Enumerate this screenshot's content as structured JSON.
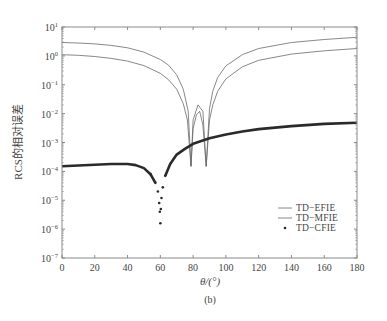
{
  "chart_data": {
    "type": "line",
    "title": "",
    "caption": "(b)",
    "xlabel": "θ/(°)",
    "ylabel": "RCS的相对误差",
    "xlim": [
      0,
      180
    ],
    "ylim": [
      1e-07,
      10
    ],
    "yscale": "log",
    "grid": false,
    "legend_position": "lower right",
    "x_ticks": [
      0,
      20,
      40,
      60,
      80,
      100,
      120,
      140,
      160,
      180
    ],
    "y_tick_labels": [
      {
        "base": "10",
        "exp": "1",
        "value": 10.0
      },
      {
        "base": "10",
        "exp": "0",
        "value": 1.0
      },
      {
        "base": "10",
        "exp": "−1",
        "value": 0.1
      },
      {
        "base": "10",
        "exp": "−2",
        "value": 0.01
      },
      {
        "base": "10",
        "exp": "−3",
        "value": 0.001
      },
      {
        "base": "10",
        "exp": "−4",
        "value": 0.0001
      },
      {
        "base": "10",
        "exp": "−5",
        "value": 1e-05
      },
      {
        "base": "10",
        "exp": "−6",
        "value": 1e-06
      },
      {
        "base": "10",
        "exp": "−7",
        "value": 1e-07
      }
    ],
    "series": [
      {
        "name": "TD−EFIE",
        "style": "thin-line",
        "color": "#555555",
        "x": [
          0,
          10,
          20,
          30,
          40,
          50,
          60,
          65,
          70,
          74,
          77,
          78.7,
          80,
          83,
          86,
          88,
          90,
          92,
          95,
          100,
          110,
          120,
          140,
          160,
          180
        ],
        "y": [
          2.9,
          2.8,
          2.6,
          2.3,
          1.9,
          1.35,
          0.75,
          0.48,
          0.22,
          0.07,
          0.012,
          0.00015,
          0.006,
          0.02,
          0.012,
          0.00015,
          0.015,
          0.06,
          0.18,
          0.45,
          1.1,
          1.8,
          2.9,
          3.7,
          4.4
        ]
      },
      {
        "name": "TD−MFIE",
        "style": "thin-line",
        "color": "#555555",
        "x": [
          0,
          10,
          20,
          30,
          40,
          50,
          60,
          65,
          70,
          74,
          76.5,
          78.7,
          80,
          82,
          84,
          86,
          88,
          90,
          92,
          95,
          100,
          110,
          120,
          140,
          160,
          180
        ],
        "y": [
          1.1,
          1.05,
          0.95,
          0.82,
          0.66,
          0.46,
          0.25,
          0.15,
          0.07,
          0.022,
          0.006,
          0.00015,
          0.003,
          0.009,
          0.012,
          0.004,
          0.00015,
          0.006,
          0.02,
          0.06,
          0.16,
          0.42,
          0.7,
          1.15,
          1.5,
          1.8
        ]
      },
      {
        "name": "TD−CFIE",
        "style": "dots",
        "color": "#222222",
        "x": [
          0,
          10,
          20,
          30,
          40,
          45,
          50,
          54,
          57,
          58.5,
          59.3,
          59.7,
          60,
          60.3,
          60.7,
          61.5,
          63,
          66,
          70,
          75,
          80,
          90,
          100,
          110,
          120,
          140,
          160,
          180
        ],
        "y": [
          0.00015,
          0.00016,
          0.00017,
          0.00018,
          0.00018,
          0.000165,
          0.00013,
          8e-05,
          4e-05,
          2e-05,
          8e-06,
          4e-06,
          1.6e-06,
          5e-06,
          1.2e-05,
          2.8e-05,
          7e-05,
          0.00018,
          0.00038,
          0.0006,
          0.0009,
          0.0014,
          0.0019,
          0.0024,
          0.0029,
          0.0037,
          0.0044,
          0.0048
        ]
      }
    ]
  },
  "legend": {
    "items": [
      {
        "label": "TD−EFIE",
        "marker": "line"
      },
      {
        "label": "TD−MFIE",
        "marker": "line"
      },
      {
        "label": "TD−CFIE",
        "marker": "dot"
      }
    ]
  },
  "colors": {
    "axis": "#8a8a8a",
    "thin_line": "#6a6a6a",
    "thick_line": "#2a2a2a",
    "text": "#444444"
  }
}
